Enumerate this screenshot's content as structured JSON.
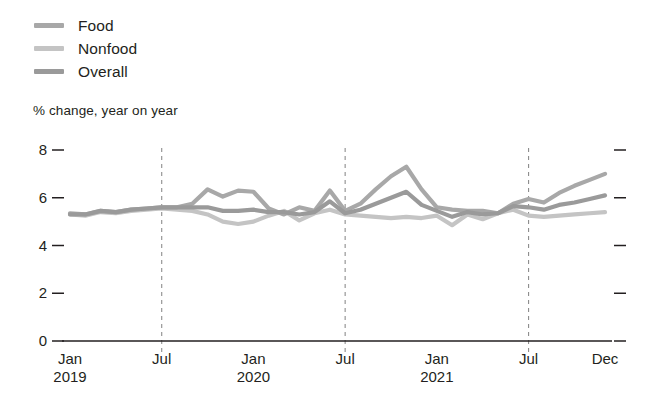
{
  "chart_data": {
    "type": "line",
    "title": "",
    "subtitle": "",
    "xlabel": "",
    "ylabel": "% change, year on year",
    "ylim": [
      0,
      8
    ],
    "yticks": [
      "0",
      "2",
      "4",
      "6",
      "8"
    ],
    "grid": false,
    "legend_position": "top-left",
    "x": [
      "Jan 2019",
      "Feb 2019",
      "Mar 2019",
      "Apr 2019",
      "May 2019",
      "Jun 2019",
      "Jul 2019",
      "Aug 2019",
      "Sep 2019",
      "Oct 2019",
      "Nov 2019",
      "Dec 2019",
      "Jan 2020",
      "Feb 2020",
      "Mar 2020",
      "Apr 2020",
      "May 2020",
      "Jun 2020",
      "Jul 2020",
      "Aug 2020",
      "Sep 2020",
      "Oct 2020",
      "Nov 2020",
      "Dec 2020",
      "Jan 2021",
      "Feb 2021",
      "Mar 2021",
      "Apr 2021",
      "May 2021",
      "Jun 2021",
      "Jul 2021",
      "Aug 2021",
      "Sep 2021",
      "Oct 2021",
      "Nov 2021",
      "Dec 2021"
    ],
    "xtick_labels": [
      {
        "top": "Jan",
        "bottom": "2019",
        "index": 0
      },
      {
        "top": "Jul",
        "bottom": "",
        "index": 6
      },
      {
        "top": "Jan",
        "bottom": "2020",
        "index": 12
      },
      {
        "top": "Jul",
        "bottom": "",
        "index": 18
      },
      {
        "top": "Jan",
        "bottom": "2021",
        "index": 24
      },
      {
        "top": "Jul",
        "bottom": "",
        "index": 30
      },
      {
        "top": "Dec",
        "bottom": "",
        "index": 35
      }
    ],
    "vertical_dashed_at": [
      6,
      18,
      30
    ],
    "series": [
      {
        "name": "Food",
        "color": "#a8a8a8",
        "values": [
          5.35,
          5.3,
          5.45,
          5.4,
          5.5,
          5.55,
          5.6,
          5.6,
          5.75,
          6.35,
          6.05,
          6.3,
          6.25,
          5.55,
          5.3,
          5.6,
          5.45,
          6.3,
          5.45,
          5.75,
          6.35,
          6.9,
          7.3,
          6.35,
          5.6,
          5.5,
          5.45,
          5.45,
          5.35,
          5.75,
          5.95,
          5.8,
          6.2,
          6.5,
          6.75,
          7.0
        ]
      },
      {
        "name": "Nonfood",
        "color": "#c4c4c4",
        "values": [
          5.3,
          5.25,
          5.4,
          5.35,
          5.45,
          5.5,
          5.55,
          5.5,
          5.45,
          5.3,
          5.0,
          4.9,
          5.0,
          5.25,
          5.45,
          5.05,
          5.35,
          5.5,
          5.3,
          5.25,
          5.2,
          5.15,
          5.2,
          5.15,
          5.25,
          4.85,
          5.3,
          5.1,
          5.35,
          5.5,
          5.25,
          5.2,
          5.25,
          5.3,
          5.35,
          5.4
        ]
      },
      {
        "name": "Overall",
        "color": "#9a9a9a",
        "values": [
          5.3,
          5.3,
          5.45,
          5.4,
          5.5,
          5.55,
          5.6,
          5.6,
          5.6,
          5.6,
          5.45,
          5.45,
          5.5,
          5.4,
          5.4,
          5.3,
          5.4,
          5.85,
          5.35,
          5.5,
          5.75,
          6.0,
          6.25,
          5.7,
          5.45,
          5.2,
          5.4,
          5.3,
          5.35,
          5.65,
          5.6,
          5.5,
          5.7,
          5.8,
          5.95,
          6.1
        ]
      }
    ]
  }
}
